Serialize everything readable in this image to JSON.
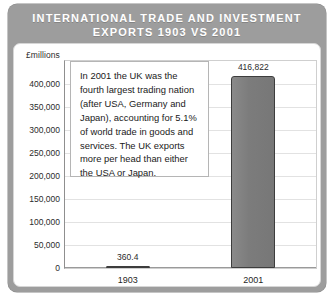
{
  "card": {
    "title_line1": "INTERNATIONAL TRADE AND INVESTMENT",
    "title_line2": "EXPORTS 1903 VS 2001",
    "band_color": "#9d9d9d",
    "title_color": "#ffffff",
    "panel_color": "#ffffff"
  },
  "annotation": {
    "text": "In 2001 the UK was the fourth largest trading nation (after USA, Germany and Japan), accounting for 5.1% of world trade in goods and services. The UK exports more per head than either the USA or Japan."
  },
  "axis": {
    "units_label": "£millions"
  },
  "chart_data": {
    "type": "bar",
    "title": "INTERNATIONAL TRADE AND INVESTMENT EXPORTS 1903 VS 2001",
    "subtitle": "",
    "xlabel": "",
    "ylabel": "£millions",
    "categories": [
      "1903",
      "2001"
    ],
    "values": [
      360.4,
      416822
    ],
    "value_labels": [
      "360.4",
      "416,822"
    ],
    "ylim": [
      0,
      450000
    ],
    "yticks": [
      0,
      50000,
      100000,
      150000,
      200000,
      250000,
      300000,
      350000,
      400000
    ],
    "ytick_labels": [
      "0",
      "50,000",
      "100,000",
      "150,000",
      "200,000",
      "250,000",
      "300,000",
      "350,000",
      "400,000"
    ],
    "grid": true,
    "legend": "none",
    "bar_fill": "#7f7f7f",
    "bar_edge": "#3d3d3d"
  }
}
